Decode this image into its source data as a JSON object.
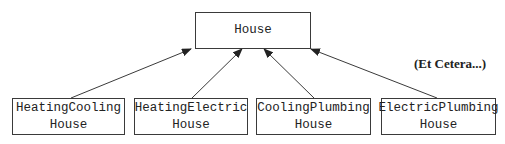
{
  "diagram": {
    "type": "class-inheritance",
    "parent": {
      "label": "House"
    },
    "children": [
      {
        "line1": "HeatingCooling",
        "line2": "House"
      },
      {
        "line1": "HeatingElectric",
        "line2": "House"
      },
      {
        "line1": "CoolingPlumbing",
        "line2": "House"
      },
      {
        "line1": "ElectricPlumbing",
        "line2": "House"
      }
    ],
    "note": "(Et Cetera...)",
    "edges": [
      {
        "from": "HeatingCoolingHouse",
        "to": "House",
        "style": "arrow"
      },
      {
        "from": "HeatingElectricHouse",
        "to": "House",
        "style": "arrow"
      },
      {
        "from": "CoolingPlumbingHouse",
        "to": "House",
        "style": "arrow"
      },
      {
        "from": "ElectricPlumbingHouse",
        "to": "House",
        "style": "arrow"
      }
    ],
    "colors": {
      "line": "#3a3a3a",
      "text": "#222222",
      "background": "#ffffff"
    }
  }
}
